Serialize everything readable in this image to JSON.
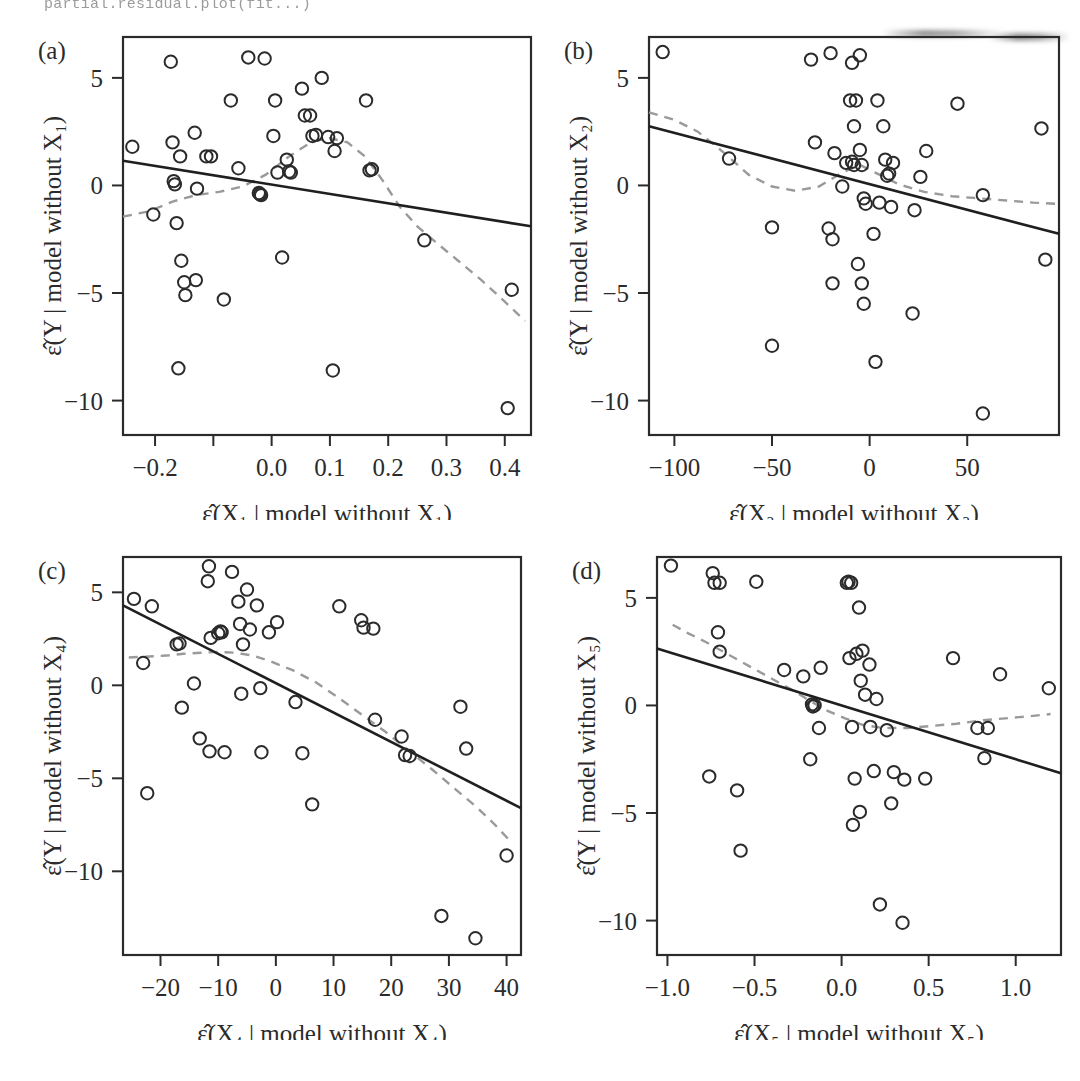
{
  "figure": {
    "top_code_fragment": "partial.residual.plot(fit...)",
    "axis_color": "#2b2b2b",
    "point_color": "#2b2b2b",
    "fit_line_color": "#1f1f1f",
    "smooth_line_color": "#9a9a9a",
    "background": "#ffffff"
  },
  "chart_data": [
    {
      "type": "scatter",
      "panel_label": "(a)",
      "title": "",
      "xlabel": "ε̂(X₁ | model without X₁)",
      "ylabel": "ε̂(Y | model without X₁)",
      "xlim": [
        -0.255,
        0.445
      ],
      "ylim": [
        -11.6,
        6.9
      ],
      "xticks": [
        -0.2,
        -0.1,
        0.0,
        0.1,
        0.2,
        0.3,
        0.4
      ],
      "xticklabels": [
        "−0.2",
        "",
        "0.0",
        "0.1",
        "0.2",
        "0.3",
        "0.4"
      ],
      "yticks": [
        5,
        0,
        -5,
        -10
      ],
      "yticklabels": [
        "5",
        "0",
        "−5",
        "−10"
      ],
      "grid": false,
      "legend": "none",
      "x": [
        -0.239,
        -0.203,
        -0.173,
        -0.17,
        -0.168,
        -0.166,
        -0.163,
        -0.16,
        -0.157,
        -0.155,
        -0.15,
        -0.148,
        -0.132,
        -0.13,
        -0.128,
        -0.112,
        -0.104,
        -0.082,
        -0.07,
        -0.057,
        -0.04,
        -0.022,
        -0.02,
        -0.018,
        -0.012,
        0.003,
        0.006,
        0.01,
        0.018,
        0.026,
        0.03,
        0.033,
        0.052,
        0.057,
        0.066,
        0.07,
        0.076,
        0.086,
        0.097,
        0.105,
        0.108,
        0.112,
        0.162,
        0.168,
        0.172,
        0.262,
        0.405,
        0.412
      ],
      "y": [
        1.8,
        -1.35,
        5.75,
        2.0,
        0.2,
        0.05,
        -1.75,
        -8.5,
        1.35,
        -3.5,
        -4.5,
        -5.1,
        2.45,
        -4.4,
        -0.15,
        1.35,
        1.35,
        -5.3,
        3.95,
        0.8,
        5.95,
        -0.35,
        -0.4,
        -0.45,
        5.9,
        2.3,
        3.95,
        0.6,
        -3.35,
        1.2,
        0.65,
        0.6,
        4.5,
        3.25,
        3.25,
        2.3,
        2.35,
        5.0,
        2.25,
        -8.6,
        1.6,
        2.2,
        3.95,
        0.7,
        0.75,
        -2.55,
        -10.35,
        -4.85
      ],
      "fit_line": {
        "x": [
          -0.255,
          0.445
        ],
        "y": [
          1.15,
          -1.9
        ]
      },
      "smooth_line": {
        "x": [
          -0.255,
          -0.21,
          -0.17,
          -0.13,
          -0.09,
          -0.05,
          -0.01,
          0.03,
          0.07,
          0.1,
          0.13,
          0.16,
          0.19,
          0.22,
          0.25,
          0.28,
          0.32,
          0.36,
          0.4,
          0.435
        ],
        "y": [
          -1.45,
          -1.2,
          -0.75,
          -0.45,
          -0.3,
          -0.05,
          0.5,
          1.35,
          2.05,
          2.2,
          2.0,
          1.35,
          0.25,
          -1.0,
          -1.9,
          -2.6,
          -3.5,
          -4.4,
          -5.4,
          -6.3
        ]
      }
    },
    {
      "type": "scatter",
      "panel_label": "(b)",
      "title": "",
      "xlabel": "ε̂(X₂ | model without X₂)",
      "ylabel": "ε̂(Y | model without X₂)",
      "xlim": [
        -113,
        97
      ],
      "ylim": [
        -11.6,
        6.9
      ],
      "xticks": [
        -100,
        -50,
        0,
        50
      ],
      "xticklabels": [
        "−100",
        "−50",
        "0",
        "50"
      ],
      "yticks": [
        5,
        0,
        -5,
        -10
      ],
      "yticklabels": [
        "5",
        "0",
        "−5",
        "−10"
      ],
      "grid": false,
      "legend": "none",
      "x": [
        -106,
        -72,
        -50,
        -50,
        -30,
        -28,
        -21,
        -20,
        -19,
        -19,
        -18,
        -14,
        -12,
        -10,
        -9,
        -9,
        -8,
        -8,
        -7,
        -6,
        -5,
        -5,
        -4,
        -4,
        -3,
        -3,
        -2,
        2,
        3,
        4,
        5,
        7,
        8,
        9,
        10,
        11,
        12,
        22,
        23,
        26,
        29,
        45,
        58,
        58,
        88,
        90
      ],
      "y": [
        6.2,
        1.25,
        -1.95,
        -7.45,
        5.85,
        2.0,
        -2.0,
        6.15,
        -2.5,
        -4.55,
        1.5,
        -0.05,
        1.05,
        3.95,
        5.7,
        1.1,
        2.75,
        0.95,
        3.95,
        -3.65,
        6.05,
        1.65,
        0.95,
        -4.55,
        -0.6,
        -5.5,
        -0.85,
        -2.25,
        -8.2,
        3.95,
        -0.8,
        2.75,
        1.2,
        0.45,
        0.55,
        -1.0,
        1.05,
        -5.95,
        -1.15,
        0.4,
        1.6,
        3.8,
        -0.45,
        -10.6,
        2.65,
        -3.45
      ],
      "fit_line": {
        "x": [
          -113,
          97
        ],
        "y": [
          2.75,
          -2.25
        ]
      },
      "smooth_line": {
        "x": [
          -113,
          -100,
          -88,
          -75,
          -62,
          -50,
          -38,
          -26,
          -14,
          -5,
          5,
          15,
          28,
          42,
          56,
          70,
          84,
          95
        ],
        "y": [
          3.4,
          3.05,
          2.5,
          1.55,
          0.5,
          -0.05,
          -0.25,
          -0.05,
          0.6,
          0.95,
          0.5,
          0.05,
          -0.3,
          -0.5,
          -0.6,
          -0.7,
          -0.8,
          -0.85
        ]
      }
    },
    {
      "type": "scatter",
      "panel_label": "(c)",
      "title": "",
      "xlabel": "ε̂(X₄ | model without X₄)",
      "ylabel": "ε̂(Y | model without X₄)",
      "xlim": [
        -26.5,
        42.5
      ],
      "ylim": [
        -14.5,
        6.9
      ],
      "xticks": [
        -20,
        -10,
        0,
        10,
        20,
        30,
        40
      ],
      "xticklabels": [
        "−20",
        "−10",
        "0",
        "10",
        "20",
        "30",
        "40"
      ],
      "yticks": [
        5,
        0,
        -5,
        -10
      ],
      "yticklabels": [
        "5",
        "0",
        "−5",
        "−10"
      ],
      "grid": false,
      "legend": "none",
      "x": [
        -24.6,
        -23.0,
        -22.3,
        -21.5,
        -17.2,
        -16.7,
        -16.3,
        -14.2,
        -13.2,
        -11.8,
        -11.6,
        -11.5,
        -11.3,
        -10.0,
        -9.6,
        -9.4,
        -8.9,
        -7.6,
        -6.5,
        -6.2,
        -6.0,
        -5.7,
        -5.0,
        -4.5,
        -3.3,
        -2.7,
        -2.5,
        -1.2,
        0.2,
        3.4,
        4.6,
        6.3,
        11.0,
        14.8,
        15.2,
        16.9,
        17.2,
        21.8,
        22.4,
        23.2,
        28.7,
        32.0,
        33.0,
        34.6,
        40.0
      ],
      "y": [
        4.65,
        1.2,
        -5.8,
        4.25,
        2.2,
        2.25,
        -1.2,
        0.1,
        -2.85,
        5.6,
        6.4,
        -3.55,
        2.55,
        2.8,
        2.9,
        2.85,
        -3.6,
        6.1,
        4.5,
        3.3,
        -0.45,
        2.2,
        5.15,
        3.0,
        4.3,
        -0.15,
        -3.6,
        2.85,
        3.4,
        -0.9,
        -3.65,
        -6.4,
        4.25,
        3.5,
        3.1,
        3.05,
        -1.85,
        -2.75,
        -3.75,
        -3.8,
        -12.4,
        -1.15,
        -3.4,
        -13.6,
        -9.15
      ],
      "fit_line": {
        "x": [
          -26.5,
          42.5
        ],
        "y": [
          4.3,
          -6.6
        ]
      },
      "smooth_line": {
        "x": [
          -25.5,
          -22,
          -19,
          -16,
          -13,
          -10,
          -7,
          -4,
          -1,
          3,
          7,
          11,
          15,
          19,
          23,
          27,
          31,
          35,
          38,
          41
        ],
        "y": [
          1.5,
          1.55,
          1.6,
          1.7,
          1.75,
          1.8,
          1.75,
          1.6,
          1.3,
          0.8,
          0.15,
          -0.7,
          -1.6,
          -2.5,
          -3.5,
          -4.5,
          -5.55,
          -6.6,
          -7.5,
          -8.5
        ]
      }
    },
    {
      "type": "scatter",
      "panel_label": "(d)",
      "title": "",
      "xlabel": "ε̂(X₅ | model without X₅)",
      "ylabel": "ε̂(Y | model without X₅)",
      "xlim": [
        -1.06,
        1.26
      ],
      "ylim": [
        -11.6,
        6.9
      ],
      "xticks": [
        -1.0,
        -0.5,
        0.0,
        0.5,
        1.0
      ],
      "xticklabels": [
        "−1.0",
        "−0.5",
        "0.0",
        "0.5",
        "1.0"
      ],
      "yticks": [
        5,
        0,
        -5,
        -10
      ],
      "yticklabels": [
        "5",
        "0",
        "−5",
        "−10"
      ],
      "grid": false,
      "legend": "none",
      "x": [
        -0.98,
        -0.76,
        -0.74,
        -0.73,
        -0.71,
        -0.7,
        -0.7,
        -0.6,
        -0.58,
        -0.49,
        -0.33,
        -0.22,
        -0.18,
        -0.17,
        -0.165,
        -0.155,
        -0.13,
        -0.12,
        0.03,
        0.04,
        0.045,
        0.055,
        0.06,
        0.065,
        0.075,
        0.085,
        0.1,
        0.105,
        0.11,
        0.12,
        0.135,
        0.16,
        0.165,
        0.185,
        0.2,
        0.22,
        0.26,
        0.285,
        0.3,
        0.35,
        0.36,
        0.48,
        0.64,
        0.78,
        0.82,
        0.84,
        0.91,
        1.19
      ],
      "y": [
        6.5,
        -3.3,
        6.15,
        5.7,
        3.4,
        2.5,
        5.7,
        -3.95,
        -6.75,
        5.75,
        1.65,
        1.35,
        -2.5,
        0.05,
        -0.05,
        0.0,
        -1.05,
        1.75,
        5.7,
        5.75,
        2.2,
        5.7,
        -1.0,
        -5.55,
        -3.4,
        2.4,
        4.55,
        -4.95,
        1.15,
        2.55,
        0.5,
        1.9,
        -1.0,
        -3.05,
        0.3,
        -9.25,
        -1.15,
        -4.55,
        -3.1,
        -10.1,
        -3.45,
        -3.4,
        2.2,
        -1.05,
        -2.45,
        -1.05,
        1.45,
        0.8
      ],
      "fit_line": {
        "x": [
          -1.06,
          1.26
        ],
        "y": [
          2.65,
          -3.15
        ]
      },
      "smooth_line": {
        "x": [
          -0.97,
          -0.88,
          -0.78,
          -0.68,
          -0.58,
          -0.48,
          -0.38,
          -0.28,
          -0.18,
          -0.08,
          0.02,
          0.12,
          0.24,
          0.38,
          0.52,
          0.66,
          0.8,
          0.94,
          1.08,
          1.2
        ],
        "y": [
          3.75,
          3.35,
          2.95,
          2.5,
          2.05,
          1.6,
          1.15,
          0.7,
          0.2,
          -0.25,
          -0.6,
          -0.9,
          -1.05,
          -1.05,
          -0.95,
          -0.85,
          -0.7,
          -0.6,
          -0.5,
          -0.4
        ]
      }
    }
  ]
}
